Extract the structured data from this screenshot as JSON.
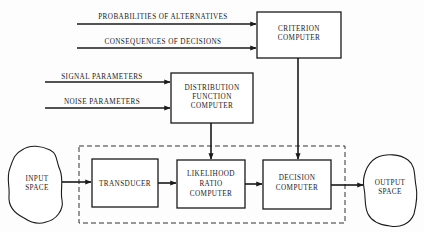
{
  "diagram": {
    "inputs": {
      "probabilities": "PROBABILITIES OF ALTERNATIVES",
      "consequences": "CONSEQUENCES OF DECISIONS",
      "signal": "SIGNAL PARAMETERS",
      "noise": "NOISE PARAMETERS"
    },
    "blocks": {
      "criterion": [
        "CRITERION",
        "COMPUTER"
      ],
      "distribution": [
        "DISTRIBUTION",
        "FUNCTION",
        "COMPUTER"
      ],
      "transducer": [
        "TRANSDUCER"
      ],
      "likelihood": [
        "LIKELIHOOD",
        "RATIO",
        "COMPUTER"
      ],
      "decision": [
        "DECISION",
        "COMPUTER"
      ]
    },
    "spaces": {
      "input": [
        "INPUT",
        "SPACE"
      ],
      "output": [
        "OUTPUT",
        "SPACE"
      ]
    },
    "colors": {
      "ink": "#1a1a1a",
      "background": "#fdfdfd"
    }
  }
}
